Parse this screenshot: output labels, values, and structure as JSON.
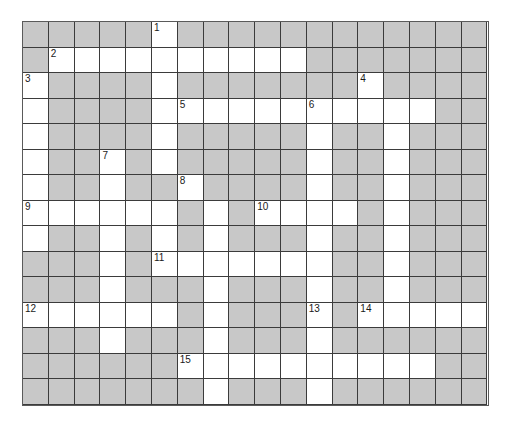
{
  "puzzle": {
    "title": "Crossword Grid",
    "type": "crossword",
    "columns": 18,
    "rows": 15,
    "cell_size_px": 25.8,
    "colors": {
      "block_fill": "#c8c8c8",
      "open_fill": "#ffffff",
      "grid_line": "#3b3b3b",
      "number_text": "#1a1a1a",
      "page_background": "#ffffff"
    },
    "legend": {
      "open_cell_meaning": "letter cell",
      "block_cell_meaning": "blocked cell"
    },
    "clue_numbers": [
      {
        "number": "1",
        "row": 0,
        "col": 5
      },
      {
        "number": "2",
        "row": 1,
        "col": 1
      },
      {
        "number": "3",
        "row": 2,
        "col": 0
      },
      {
        "number": "4",
        "row": 2,
        "col": 13
      },
      {
        "number": "5",
        "row": 3,
        "col": 6
      },
      {
        "number": "6",
        "row": 3,
        "col": 11
      },
      {
        "number": "7",
        "row": 5,
        "col": 3
      },
      {
        "number": "8",
        "row": 6,
        "col": 6
      },
      {
        "number": "9",
        "row": 7,
        "col": 0
      },
      {
        "number": "10",
        "row": 7,
        "col": 9
      },
      {
        "number": "11",
        "row": 9,
        "col": 5
      },
      {
        "number": "12",
        "row": 11,
        "col": 0
      },
      {
        "number": "13",
        "row": 11,
        "col": 11
      },
      {
        "number": "14",
        "row": 11,
        "col": 13
      },
      {
        "number": "15",
        "row": 13,
        "col": 6
      }
    ],
    "open_cells": [
      [
        0,
        5
      ],
      [
        1,
        1
      ],
      [
        1,
        2
      ],
      [
        1,
        3
      ],
      [
        1,
        4
      ],
      [
        1,
        5
      ],
      [
        1,
        6
      ],
      [
        1,
        7
      ],
      [
        1,
        8
      ],
      [
        1,
        9
      ],
      [
        1,
        10
      ],
      [
        2,
        0
      ],
      [
        2,
        5
      ],
      [
        2,
        13
      ],
      [
        3,
        0
      ],
      [
        3,
        5
      ],
      [
        3,
        6
      ],
      [
        3,
        7
      ],
      [
        3,
        8
      ],
      [
        3,
        9
      ],
      [
        3,
        10
      ],
      [
        3,
        11
      ],
      [
        3,
        12
      ],
      [
        3,
        13
      ],
      [
        3,
        14
      ],
      [
        3,
        15
      ],
      [
        4,
        0
      ],
      [
        4,
        5
      ],
      [
        4,
        11
      ],
      [
        4,
        14
      ],
      [
        5,
        0
      ],
      [
        5,
        3
      ],
      [
        5,
        5
      ],
      [
        5,
        11
      ],
      [
        5,
        14
      ],
      [
        6,
        0
      ],
      [
        6,
        3
      ],
      [
        6,
        6
      ],
      [
        6,
        11
      ],
      [
        6,
        14
      ],
      [
        7,
        0
      ],
      [
        7,
        1
      ],
      [
        7,
        2
      ],
      [
        7,
        3
      ],
      [
        7,
        4
      ],
      [
        7,
        5
      ],
      [
        7,
        7
      ],
      [
        7,
        9
      ],
      [
        7,
        10
      ],
      [
        7,
        11
      ],
      [
        7,
        12
      ],
      [
        7,
        14
      ],
      [
        8,
        0
      ],
      [
        8,
        3
      ],
      [
        8,
        5
      ],
      [
        8,
        7
      ],
      [
        8,
        11
      ],
      [
        8,
        14
      ],
      [
        9,
        3
      ],
      [
        9,
        5
      ],
      [
        9,
        6
      ],
      [
        9,
        7
      ],
      [
        9,
        8
      ],
      [
        9,
        9
      ],
      [
        9,
        10
      ],
      [
        9,
        11
      ],
      [
        9,
        14
      ],
      [
        10,
        3
      ],
      [
        10,
        7
      ],
      [
        10,
        11
      ],
      [
        10,
        14
      ],
      [
        11,
        0
      ],
      [
        11,
        1
      ],
      [
        11,
        2
      ],
      [
        11,
        3
      ],
      [
        11,
        4
      ],
      [
        11,
        5
      ],
      [
        11,
        7
      ],
      [
        11,
        11
      ],
      [
        11,
        13
      ],
      [
        11,
        14
      ],
      [
        11,
        15
      ],
      [
        11,
        16
      ],
      [
        11,
        17
      ],
      [
        12,
        3
      ],
      [
        12,
        7
      ],
      [
        12,
        11
      ],
      [
        13,
        6
      ],
      [
        13,
        7
      ],
      [
        13,
        8
      ],
      [
        13,
        9
      ],
      [
        13,
        10
      ],
      [
        13,
        11
      ],
      [
        13,
        12
      ],
      [
        13,
        13
      ],
      [
        13,
        14
      ],
      [
        13,
        15
      ],
      [
        14,
        7
      ],
      [
        14,
        11
      ]
    ]
  }
}
